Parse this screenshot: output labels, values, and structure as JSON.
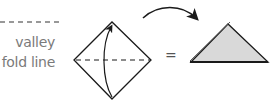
{
  "legend": {
    "line_style": "dashed",
    "label_line1": "valley",
    "label_line2": "fold line"
  },
  "step": {
    "shape_before": "square-diamond",
    "fold_line": "horizontal-diagonal-valley",
    "fold_direction": "bottom-corner-up-to-top-corner",
    "operator": "=",
    "shape_after": "triangle"
  },
  "colors": {
    "line": "#1a1a1a",
    "label_text": "#7a7a7a",
    "triangle_fill": "#d9d9d9",
    "background": "#ffffff"
  }
}
